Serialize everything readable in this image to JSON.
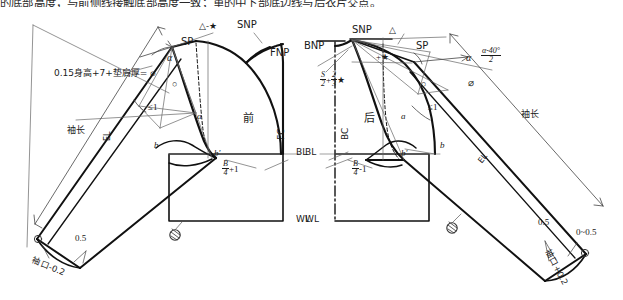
{
  "page": {
    "cropped_top_text": "的底部高度，与前侧线接触底部高度一致；重的中下部底边线与后衣片交点。",
    "width": 623,
    "height": 300,
    "ink_color": "#111111",
    "thin_color": "#555555",
    "paper_color": "#ffffff"
  },
  "diagram": {
    "type": "garment-pattern-draft",
    "panels": [
      {
        "id": "front",
        "label": "前",
        "side": "left"
      },
      {
        "id": "back",
        "label": "后",
        "side": "right"
      }
    ]
  },
  "front": {
    "point_snp": "SNP",
    "point_fnp": "FNP",
    "point_sp": "SP",
    "shoulder_note": "△-★",
    "center_front": "FC",
    "panel_name": "前",
    "bust_line": "BL",
    "waist_line": "WL",
    "angle_alpha": "α",
    "ease_note": "≤1",
    "circle_mark": "○",
    "sleeve_cap_formula": "0.15身高+7+垫肩厚= ⌀",
    "sleeve_length": "袖长",
    "elbow_line": "EL",
    "chest_formula_num": "B",
    "chest_formula_den": "4",
    "chest_formula_tail": "+1",
    "notch_b": "b",
    "notch_b_prime": "b′",
    "curve_a": "a",
    "cuff_ease": "0.5",
    "cuff_formula": "袖口-0.2"
  },
  "back": {
    "point_snp": "SNP",
    "point_bnp": "BNP",
    "point_sp": "SP",
    "shoulder_note_tri": "△",
    "shoulder_note_star": "+★",
    "center_back": "BC",
    "panel_name": "后",
    "bust_line": "BL",
    "waist_line": "WL",
    "neck_formula_num": "S",
    "neck_formula_den": "2",
    "neck_formula_num2": "2",
    "neck_formula_den2": "3",
    "neck_formula_tail": "★",
    "neck_formula_plus": "+",
    "angle_alpha": "α",
    "angle_alpha_eq": "α-40°",
    "angle_alpha_den": "2",
    "diameter_mark": "⌀",
    "ease_note": "≤1",
    "circle_mark": "○",
    "sleeve_length": "袖长",
    "elbow_line": "EL",
    "chest_formula_num": "B",
    "chest_formula_den": "4",
    "chest_formula_tail": "-1",
    "notch_b": "b",
    "notch_b_prime": "b′",
    "curve_a": "a",
    "cuff_ease": "0.5",
    "cuff_range": "0~0.5",
    "cuff_formula": "袖口+0.2"
  }
}
